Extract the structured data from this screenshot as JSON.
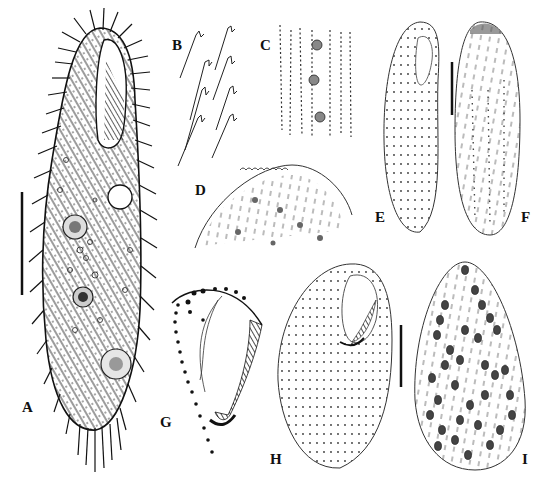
{
  "figure": {
    "background": "#ffffff",
    "ink_color": "#111111",
    "panels": [
      {
        "id": "A",
        "label": "A",
        "description": "whole cell, ventral view, densely ciliated with oral groove and nuclei",
        "label_pos": [
          22,
          400
        ],
        "scale_bar": {
          "x": 22,
          "y1": 192,
          "y2": 295
        }
      },
      {
        "id": "B",
        "label": "B",
        "description": "detail of cilia and kinetosomes",
        "label_pos": [
          172,
          38
        ]
      },
      {
        "id": "C",
        "label": "C",
        "description": "detail of cortical granules / kineties",
        "label_pos": [
          260,
          38
        ]
      },
      {
        "id": "D",
        "label": "D",
        "description": "apical cap with cortical granules",
        "label_pos": [
          195,
          183
        ]
      },
      {
        "id": "E",
        "label": "E",
        "description": "silver-stained infraciliature, ventral",
        "label_pos": [
          375,
          210
        ],
        "scale_bar": {
          "x": 452,
          "y1": 62,
          "y2": 115
        }
      },
      {
        "id": "F",
        "label": "F",
        "description": "silver-stained infraciliature, dorsal",
        "label_pos": [
          521,
          210
        ]
      },
      {
        "id": "G",
        "label": "G",
        "description": "oral apparatus detail",
        "label_pos": [
          160,
          415
        ]
      },
      {
        "id": "H",
        "label": "H",
        "description": "infraciliature, ventral view",
        "label_pos": [
          270,
          452
        ],
        "scale_bar": {
          "x": 401,
          "y1": 325,
          "y2": 387
        }
      },
      {
        "id": "I",
        "label": "I",
        "description": "macronuclear fragments",
        "label_pos": [
          522,
          452
        ]
      }
    ]
  }
}
